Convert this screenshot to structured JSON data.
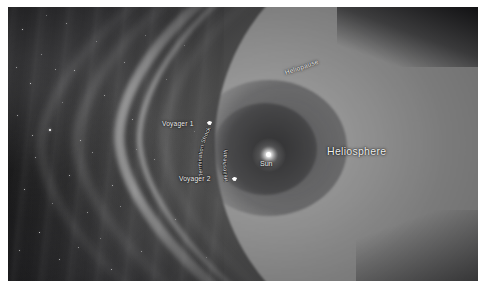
{
  "figure": {
    "background_color": "#0a0a0c",
    "label_color": "#f2f2f2"
  },
  "labels": {
    "heliosphere": "Heliosphere",
    "heliopause": "Heliopause",
    "termination_shock": "Termination Shock",
    "heliosheath": "Heliosheath",
    "sun": "Sun",
    "voyager_1": "Voyager 1",
    "voyager_2": "Voyager 2"
  },
  "objects": {
    "sun": {
      "name": "Sun",
      "marker": "star-point"
    },
    "voyager_1": {
      "name": "Voyager 1",
      "marker": "spacecraft-icon"
    },
    "voyager_2": {
      "name": "Voyager 2",
      "marker": "spacecraft-icon"
    }
  },
  "regions": {
    "heliosphere": "Heliosphere",
    "heliopause": "Heliopause",
    "termination_shock": "Termination Shock",
    "heliosheath": "Heliosheath",
    "interstellar_medium": "Interstellar medium"
  }
}
